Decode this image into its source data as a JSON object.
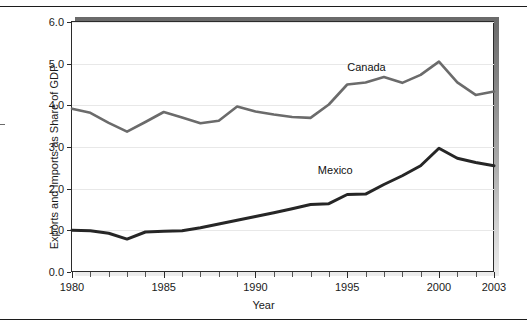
{
  "figure": {
    "background_color": "#ffffff",
    "frame_color": "#2b2b2b",
    "shadow_color": "#6a6a6a"
  },
  "chart_data": {
    "type": "line",
    "title": "",
    "subtitle": "",
    "xlabel": "Year",
    "ylabel": "Exports and Imports as Share of GDP",
    "xlim": [
      1980,
      2003
    ],
    "ylim": [
      0.0,
      6.0
    ],
    "grid": true,
    "legend_position": "inline-annotation",
    "y_ticks": [
      "0.0",
      "1.0",
      "2.0",
      "3.0",
      "4.0",
      "5.0",
      "6.0"
    ],
    "y_tick_values": [
      0.0,
      1.0,
      2.0,
      3.0,
      4.0,
      5.0,
      6.0
    ],
    "x_ticks": [
      "1980",
      "1985",
      "1990",
      "1995",
      "2000",
      "2003"
    ],
    "x_tick_values": [
      1980,
      1985,
      1990,
      1995,
      2000,
      2003
    ],
    "x": [
      1980,
      1981,
      1982,
      1983,
      1984,
      1985,
      1986,
      1987,
      1988,
      1989,
      1990,
      1991,
      1992,
      1993,
      1994,
      1995,
      1996,
      1997,
      1998,
      1999,
      2000,
      2001,
      2002,
      2003
    ],
    "series": [
      {
        "name": "Canada",
        "color": "#6b6b6b",
        "line_width": 2.6,
        "values": [
          3.92,
          3.82,
          3.58,
          3.37,
          3.6,
          3.84,
          3.71,
          3.57,
          3.63,
          3.97,
          3.85,
          3.78,
          3.72,
          3.7,
          4.02,
          4.5,
          4.55,
          4.68,
          4.54,
          4.73,
          5.05,
          4.55,
          4.25,
          4.33
        ],
        "label_text": "Canada"
      },
      {
        "name": "Mexico",
        "color": "#262626",
        "line_width": 3.0,
        "values": [
          1.0,
          0.99,
          0.93,
          0.79,
          0.96,
          0.98,
          0.99,
          1.06,
          1.15,
          1.24,
          1.33,
          1.42,
          1.52,
          1.62,
          1.64,
          1.86,
          1.87,
          2.1,
          2.31,
          2.55,
          2.97,
          2.73,
          2.63,
          2.55
        ],
        "label_text": "Mexico"
      }
    ],
    "annotations": [
      {
        "text": "Canada",
        "x": 1995.0,
        "y": 4.92
      },
      {
        "text": "Mexico",
        "x": 1993.4,
        "y": 2.44
      }
    ]
  },
  "axis": {
    "x_title": "Year",
    "y_title": "Exports and Imports as Share of GDP"
  }
}
